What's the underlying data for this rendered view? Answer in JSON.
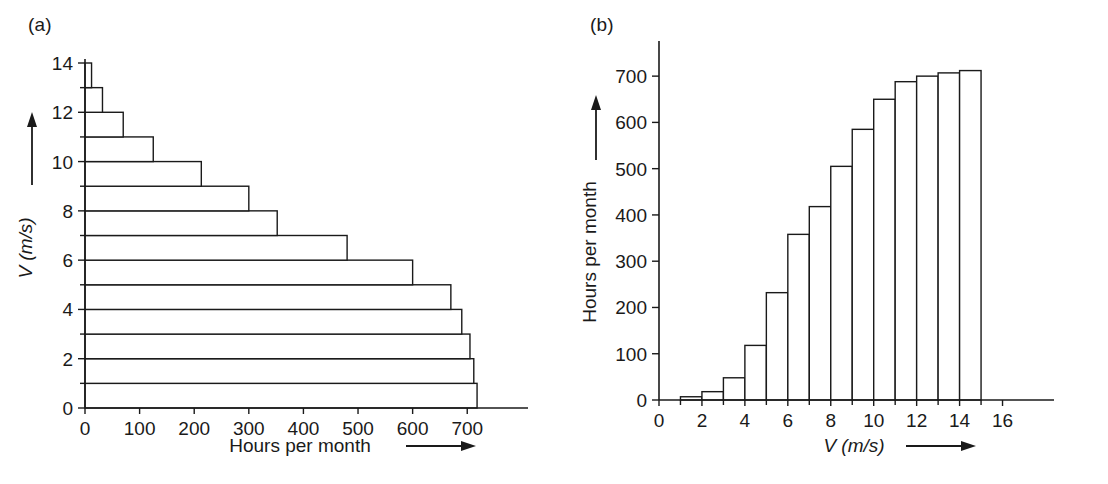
{
  "figure": {
    "panel_a_label": "(a)",
    "panel_b_label": "(b)",
    "caption": "Wind energy statistics"
  },
  "chart_data": [
    {
      "id": "panel-a",
      "type": "bar",
      "orientation": "horizontal",
      "title": "",
      "panel_label": "(a)",
      "xlabel": "Hours per month",
      "ylabel": "V (m/s)",
      "xlabel_arrow": true,
      "ylabel_arrow": true,
      "xlim": [
        0,
        760
      ],
      "ylim": [
        0,
        14
      ],
      "xticks": [
        0,
        100,
        200,
        300,
        400,
        500,
        600,
        700
      ],
      "xticklabels": [
        "0",
        "100",
        "200",
        "300",
        "400",
        "500",
        "600",
        "700"
      ],
      "yticks": [
        0,
        2,
        4,
        6,
        8,
        10,
        12,
        14
      ],
      "yticklabels": [
        "0",
        "2",
        "4",
        "6",
        "8",
        "10",
        "12",
        "14"
      ],
      "yminorticks": [
        1,
        3,
        5,
        7,
        9,
        11,
        13
      ],
      "grid": false,
      "legend": null,
      "note": "Horizontal bars: each bar spans a 1 m/s band in V; bar length is hours per month with wind speed at or above that band.",
      "bins": [
        {
          "v_low": 0,
          "v_high": 1,
          "hours": 718
        },
        {
          "v_low": 1,
          "v_high": 2,
          "hours": 712
        },
        {
          "v_low": 2,
          "v_high": 3,
          "hours": 705
        },
        {
          "v_low": 3,
          "v_high": 4,
          "hours": 690
        },
        {
          "v_low": 4,
          "v_high": 5,
          "hours": 670
        },
        {
          "v_low": 5,
          "v_high": 6,
          "hours": 600
        },
        {
          "v_low": 6,
          "v_high": 7,
          "hours": 480
        },
        {
          "v_low": 7,
          "v_high": 8,
          "hours": 352
        },
        {
          "v_low": 8,
          "v_high": 9,
          "hours": 300
        },
        {
          "v_low": 9,
          "v_high": 10,
          "hours": 213
        },
        {
          "v_low": 10,
          "v_high": 11,
          "hours": 125
        },
        {
          "v_low": 11,
          "v_high": 12,
          "hours": 70
        },
        {
          "v_low": 12,
          "v_high": 13,
          "hours": 32
        },
        {
          "v_low": 13,
          "v_high": 14,
          "hours": 12
        }
      ],
      "categories": [
        "0-1",
        "1-2",
        "2-3",
        "3-4",
        "4-5",
        "5-6",
        "6-7",
        "7-8",
        "8-9",
        "9-10",
        "10-11",
        "11-12",
        "12-13",
        "13-14"
      ],
      "values": [
        718,
        712,
        705,
        690,
        670,
        600,
        480,
        352,
        300,
        213,
        125,
        70,
        32,
        12
      ]
    },
    {
      "id": "panel-b",
      "type": "bar",
      "orientation": "vertical",
      "title": "",
      "panel_label": "(b)",
      "xlabel": "V (m/s)",
      "ylabel": "Hours per month",
      "xlabel_arrow": true,
      "ylabel_arrow": true,
      "xlim": [
        0,
        17
      ],
      "ylim": [
        0,
        750
      ],
      "xticks": [
        0,
        2,
        4,
        6,
        8,
        10,
        12,
        14,
        16
      ],
      "xticklabels": [
        "0",
        "2",
        "4",
        "6",
        "8",
        "10",
        "12",
        "14",
        "16"
      ],
      "xminorticks": [
        1,
        3,
        5,
        7,
        9,
        11,
        13,
        15
      ],
      "yticks": [
        0,
        100,
        200,
        300,
        400,
        500,
        600,
        700
      ],
      "yticklabels": [
        "0",
        "100",
        "200",
        "300",
        "400",
        "500",
        "600",
        "700"
      ],
      "grid": false,
      "legend": null,
      "note": "Vertical bars: cumulative hours per month with wind speed at or below the upper edge of each 1 m/s bin.",
      "bins": [
        {
          "v_low": 1,
          "v_high": 2,
          "hours": 7
        },
        {
          "v_low": 2,
          "v_high": 3,
          "hours": 18
        },
        {
          "v_low": 3,
          "v_high": 4,
          "hours": 48
        },
        {
          "v_low": 4,
          "v_high": 5,
          "hours": 118
        },
        {
          "v_low": 5,
          "v_high": 6,
          "hours": 232
        },
        {
          "v_low": 6,
          "v_high": 7,
          "hours": 358
        },
        {
          "v_low": 7,
          "v_high": 8,
          "hours": 418
        },
        {
          "v_low": 8,
          "v_high": 9,
          "hours": 505
        },
        {
          "v_low": 9,
          "v_high": 10,
          "hours": 585
        },
        {
          "v_low": 10,
          "v_high": 11,
          "hours": 650
        },
        {
          "v_low": 11,
          "v_high": 12,
          "hours": 688
        },
        {
          "v_low": 12,
          "v_high": 13,
          "hours": 700
        },
        {
          "v_low": 13,
          "v_high": 14,
          "hours": 707
        },
        {
          "v_low": 14,
          "v_high": 15,
          "hours": 712
        }
      ],
      "categories": [
        "1-2",
        "2-3",
        "3-4",
        "4-5",
        "5-6",
        "6-7",
        "7-8",
        "8-9",
        "9-10",
        "10-11",
        "11-12",
        "12-13",
        "13-14",
        "14-15"
      ],
      "values": [
        7,
        18,
        48,
        118,
        232,
        358,
        418,
        505,
        585,
        650,
        688,
        700,
        707,
        712
      ]
    }
  ]
}
